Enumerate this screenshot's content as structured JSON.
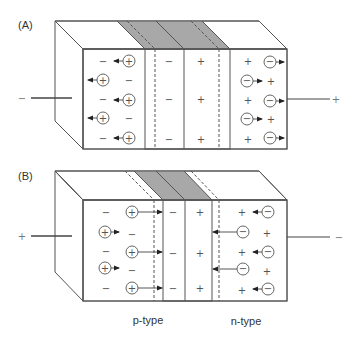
{
  "figure": {
    "colors": {
      "background": "#ffffff",
      "depletion_gray": "#a8a8a8",
      "side_face_gray": "#a6a6a6",
      "edge": "#555555",
      "text": "#333333"
    },
    "panel_a": {
      "label": "(A)",
      "description": "Forward-biased p-n junction: narrow depletion region, carriers drift away from junction",
      "left_terminal": "−",
      "right_terminal": "+",
      "depletion_left_sign": "−",
      "depletion_right_sign": "+",
      "p_region_fixed_sign": "−",
      "n_region_fixed_sign": "+",
      "hole_symbol": "+",
      "electron_symbol": "−"
    },
    "panel_b": {
      "label": "(B)",
      "description": "Reverse-biased p-n junction: carriers pushed toward junction",
      "left_terminal": "+",
      "right_terminal": "−",
      "depletion_left_sign": "−",
      "depletion_right_sign": "+",
      "p_region_fixed_sign": "−",
      "n_region_fixed_sign": "+",
      "hole_symbol": "+",
      "electron_symbol": "−"
    },
    "region_labels": {
      "p_type": "p-type",
      "n_type": "n-type"
    }
  }
}
